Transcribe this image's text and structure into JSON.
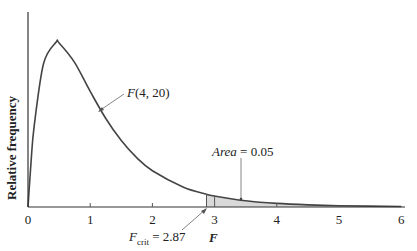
{
  "chart_data": {
    "type": "line",
    "title": "",
    "xlabel": "F",
    "ylabel": "Relative frequency",
    "xlim": [
      0,
      6
    ],
    "x_ticks": [
      "0",
      "1",
      "2",
      "3",
      "4",
      "5",
      "6"
    ],
    "grid": false,
    "series": [
      {
        "name": "F(4, 20)",
        "x": [
          0,
          0.05,
          0.1,
          0.25,
          0.45,
          0.5,
          0.75,
          1,
          1.25,
          1.5,
          1.75,
          2,
          2.5,
          2.87,
          3,
          3.5,
          4,
          4.5,
          5,
          6
        ],
        "values": [
          0,
          0.195,
          0.347,
          0.6125,
          0.704,
          0.701,
          0.617,
          0.494,
          0.378,
          0.284,
          0.21,
          0.155,
          0.0848,
          0.0546,
          0.0469,
          0.0264,
          0.0152,
          0.00885,
          0.00537,
          0.00205
        ]
      }
    ],
    "shaded_region": {
      "from": 2.87,
      "to": 6,
      "area": 0.05
    },
    "annotations": [
      {
        "text": "F(4, 20)",
        "points_to": "curve"
      },
      {
        "text": "Area = 0.05",
        "points_to": "shaded tail"
      },
      {
        "text": "F_crit = 2.87",
        "points_to": "x = 2.87"
      }
    ]
  },
  "labels": {
    "ylabel": "Relative frequency",
    "xlabel": "F",
    "curve_label_f": "F",
    "curve_label_args": "(4, 20)",
    "area_label_word": "Area",
    "area_label_value": " = 0.05",
    "fcrit_f": "F",
    "fcrit_sub": "crit",
    "fcrit_value": " = 2.87",
    "ticks": [
      "0",
      "1",
      "2",
      "3",
      "4",
      "5",
      "6"
    ]
  },
  "colors": {
    "curve": "#444444",
    "shade": "#d9d9d9",
    "axis": "#333333"
  }
}
